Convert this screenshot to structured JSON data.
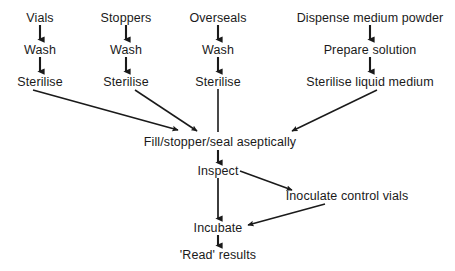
{
  "diagram": {
    "type": "flowchart",
    "stroke_color": "#1a1a1a",
    "background_color": "#ffffff",
    "nodes": [
      {
        "id": "vials",
        "label": "Vials",
        "x": 40,
        "y": 18
      },
      {
        "id": "wash1",
        "label": "Wash",
        "x": 40,
        "y": 50
      },
      {
        "id": "sterilise1",
        "label": "Sterilise",
        "x": 40,
        "y": 82
      },
      {
        "id": "stoppers",
        "label": "Stoppers",
        "x": 126,
        "y": 18
      },
      {
        "id": "wash2",
        "label": "Wash",
        "x": 126,
        "y": 50
      },
      {
        "id": "sterilise2",
        "label": "Sterilise",
        "x": 126,
        "y": 82
      },
      {
        "id": "overseals",
        "label": "Overseals",
        "x": 218,
        "y": 18
      },
      {
        "id": "wash3",
        "label": "Wash",
        "x": 218,
        "y": 50
      },
      {
        "id": "sterilise3",
        "label": "Sterilise",
        "x": 218,
        "y": 82
      },
      {
        "id": "dispense",
        "label": "Dispense medium powder",
        "x": 370,
        "y": 18
      },
      {
        "id": "prepare",
        "label": "Prepare solution",
        "x": 370,
        "y": 50
      },
      {
        "id": "sterilise4",
        "label": "Sterilise liquid medium",
        "x": 370,
        "y": 82
      },
      {
        "id": "fill",
        "label": "Fill/stopper/seal aseptically",
        "x": 220,
        "y": 142
      },
      {
        "id": "inspect",
        "label": "Inspect",
        "x": 218,
        "y": 171
      },
      {
        "id": "inoculate",
        "label": "Inoculate control vials",
        "x": 347,
        "y": 196
      },
      {
        "id": "incubate",
        "label": "Incubate",
        "x": 218,
        "y": 228
      },
      {
        "id": "read",
        "label": "'Read' results",
        "x": 218,
        "y": 255
      }
    ],
    "edges": [
      {
        "id": "vials-wash1",
        "from": "vials",
        "to": "wash1",
        "style": "vertical-arrow"
      },
      {
        "id": "wash1-sterilise1",
        "from": "wash1",
        "to": "sterilise1",
        "style": "vertical-arrow"
      },
      {
        "id": "stoppers-wash2",
        "from": "stoppers",
        "to": "wash2",
        "style": "vertical-arrow"
      },
      {
        "id": "wash2-sterilise2",
        "from": "wash2",
        "to": "sterilise2",
        "style": "vertical-arrow"
      },
      {
        "id": "overseals-wash3",
        "from": "overseals",
        "to": "wash3",
        "style": "vertical-arrow"
      },
      {
        "id": "wash3-sterilise3",
        "from": "wash3",
        "to": "sterilise3",
        "style": "vertical-arrow"
      },
      {
        "id": "dispense-prepare",
        "from": "dispense",
        "to": "prepare",
        "style": "vertical-arrow"
      },
      {
        "id": "prepare-sterilise4",
        "from": "prepare",
        "to": "sterilise4",
        "style": "vertical-arrow"
      },
      {
        "id": "sterilise1-fill",
        "from": "sterilise1",
        "to": "fill",
        "style": "diagonal-arrow"
      },
      {
        "id": "sterilise2-fill",
        "from": "sterilise2",
        "to": "fill",
        "style": "diagonal-arrow"
      },
      {
        "id": "sterilise3-fill",
        "from": "sterilise3",
        "to": "fill",
        "style": "plain-line"
      },
      {
        "id": "sterilise4-fill",
        "from": "sterilise4",
        "to": "fill",
        "style": "diagonal-arrow"
      },
      {
        "id": "fill-inspect",
        "from": "fill",
        "to": "inspect",
        "style": "vertical-arrow"
      },
      {
        "id": "inspect-inoculate",
        "from": "inspect",
        "to": "inoculate",
        "style": "diagonal-arrow"
      },
      {
        "id": "inspect-incubate",
        "from": "inspect",
        "to": "incubate",
        "style": "vertical-arrow"
      },
      {
        "id": "inoculate-incubate",
        "from": "inoculate",
        "to": "incubate",
        "style": "diagonal-arrow"
      },
      {
        "id": "incubate-read",
        "from": "incubate",
        "to": "read",
        "style": "vertical-arrow"
      }
    ]
  }
}
